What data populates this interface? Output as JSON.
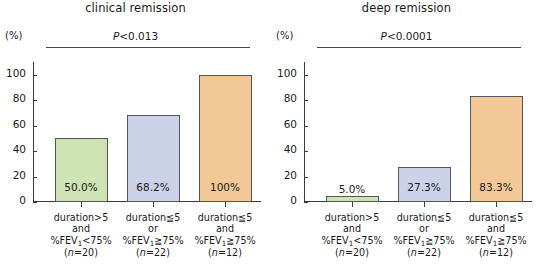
{
  "figure": {
    "axis_unit": "(%)",
    "bar_colors": {
      "green": "#cfe4b4",
      "lavender": "#ccd2e8",
      "orange": "#f2c896"
    },
    "bar_border_color": "#555555",
    "axis_color": "#3a3a3a",
    "sig_line_color": "#4a4a4a"
  },
  "chart_data": [
    {
      "type": "bar",
      "title": "clinical remission",
      "xlabel": "",
      "ylabel": "(%)",
      "ylim": [
        0,
        110
      ],
      "yticks": [
        0,
        20,
        40,
        60,
        80,
        100
      ],
      "ytick_labels": [
        "0",
        "20",
        "40",
        "60",
        "80",
        "100"
      ],
      "grid": false,
      "legend": "none",
      "annotation": "P<0.0130",
      "annotation_prefix": "P",
      "annotation_rest": "<0.013",
      "categories": [
        "duration>5 and %FEV1<75% (n=20)",
        "duration≦5 or %FEV1≧75% (n=22)",
        "duration≦5 and %FEV1≧75% (n=12)"
      ],
      "values": [
        50.0,
        68.2,
        100.0
      ],
      "value_labels": [
        "50.0%",
        "68.2%",
        "100%"
      ],
      "value_label_positions": [
        "inside",
        "inside",
        "inside"
      ],
      "colors": [
        "#cfe4b4",
        "#ccd2e8",
        "#f2c896"
      ],
      "tick_labels": [
        {
          "line1_a": "duration",
          "line1_op": ">",
          "line1_b": "5",
          "line2": "and",
          "line3_a": "%FEV",
          "line3_sub": "1",
          "line3_op": "<",
          "line3_b": "75%",
          "line4_open": "(",
          "line4_n": "n",
          "line4_rest": "=20)"
        },
        {
          "line1_a": "duration",
          "line1_op": "≦",
          "line1_b": "5",
          "line2": "or",
          "line3_a": "%FEV",
          "line3_sub": "1",
          "line3_op": "≧",
          "line3_b": "75%",
          "line4_open": "(",
          "line4_n": "n",
          "line4_rest": "=22)"
        },
        {
          "line1_a": "duration",
          "line1_op": "≦",
          "line1_b": "5",
          "line2": "and",
          "line3_a": "%FEV",
          "line3_sub": "1",
          "line3_op": "≧",
          "line3_b": "75%",
          "line4_open": "(",
          "line4_n": "n",
          "line4_rest": "=12)"
        }
      ]
    },
    {
      "type": "bar",
      "title": "deep remission",
      "xlabel": "",
      "ylabel": "(%)",
      "ylim": [
        0,
        110
      ],
      "yticks": [
        0,
        20,
        40,
        60,
        80,
        100
      ],
      "ytick_labels": [
        "0",
        "20",
        "40",
        "60",
        "80",
        "100"
      ],
      "grid": false,
      "legend": "none",
      "annotation": "P<0.0001",
      "annotation_prefix": "P",
      "annotation_rest": "<0.0001",
      "categories": [
        "duration>5 and %FEV1<75% (n=20)",
        "duration≦5 or %FEV1≧75% (n=22)",
        "duration≦5 and %FEV1≧75% (n=12)"
      ],
      "values": [
        5.0,
        27.3,
        83.3
      ],
      "value_labels": [
        "5.0%",
        "27.3%",
        "83.3%"
      ],
      "value_label_positions": [
        "outside",
        "inside",
        "inside"
      ],
      "colors": [
        "#cfe4b4",
        "#ccd2e8",
        "#f2c896"
      ],
      "tick_labels": [
        {
          "line1_a": "duration",
          "line1_op": ">",
          "line1_b": "5",
          "line2": "and",
          "line3_a": "%FEV",
          "line3_sub": "1",
          "line3_op": "<",
          "line3_b": "75%",
          "line4_open": "(",
          "line4_n": "n",
          "line4_rest": "=20)"
        },
        {
          "line1_a": "duration",
          "line1_op": "≦",
          "line1_b": "5",
          "line2": "or",
          "line3_a": "%FEV",
          "line3_sub": "1",
          "line3_op": "≧",
          "line3_b": "75%",
          "line4_open": "(",
          "line4_n": "n",
          "line4_rest": "=22)"
        },
        {
          "line1_a": "duration",
          "line1_op": "≦",
          "line1_b": "5",
          "line2": "and",
          "line3_a": "%FEV",
          "line3_sub": "1",
          "line3_op": "≧",
          "line3_b": "75%",
          "line4_open": "(",
          "line4_n": "n",
          "line4_rest": "=12)"
        }
      ]
    }
  ]
}
